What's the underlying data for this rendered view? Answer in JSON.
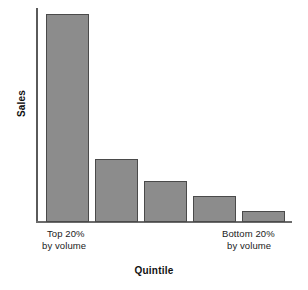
{
  "chart_data": {
    "type": "bar",
    "title": "",
    "subtitle": "",
    "xlabel": "Quintile",
    "ylabel": "Sales",
    "categories": [
      "Top 20% by volume",
      "Q2",
      "Q3",
      "Q4",
      "Bottom 20% by volume"
    ],
    "values": [
      100,
      30.3,
      19.7,
      12.5,
      5.3
    ],
    "ylim": [
      0,
      103
    ],
    "grid": false,
    "legend": null,
    "tick_labels": [
      {
        "line1": "Top 20%",
        "line2": "by volume"
      },
      {
        "line1": "Bottom 20%",
        "line2": "by volume"
      }
    ],
    "bars": [
      {
        "name": "bar-1",
        "value": 100,
        "left": 46,
        "top": 14,
        "width": 43,
        "height": 208
      },
      {
        "name": "bar-2",
        "value": 30.3,
        "left": 95,
        "top": 159,
        "width": 43,
        "height": 63
      },
      {
        "name": "bar-3",
        "value": 19.7,
        "left": 144,
        "top": 181,
        "width": 43,
        "height": 41
      },
      {
        "name": "bar-4",
        "value": 12.5,
        "left": 193,
        "top": 196,
        "width": 43,
        "height": 26
      },
      {
        "name": "bar-5",
        "value": 5.3,
        "left": 242,
        "top": 211,
        "width": 43,
        "height": 11
      }
    ],
    "colors": {
      "bar_fill": "#8c8c8c",
      "bar_border": "#4a4a4a",
      "axis": "#5a5a5a",
      "text": "#1b1b1b",
      "background": "#ffffff"
    }
  }
}
